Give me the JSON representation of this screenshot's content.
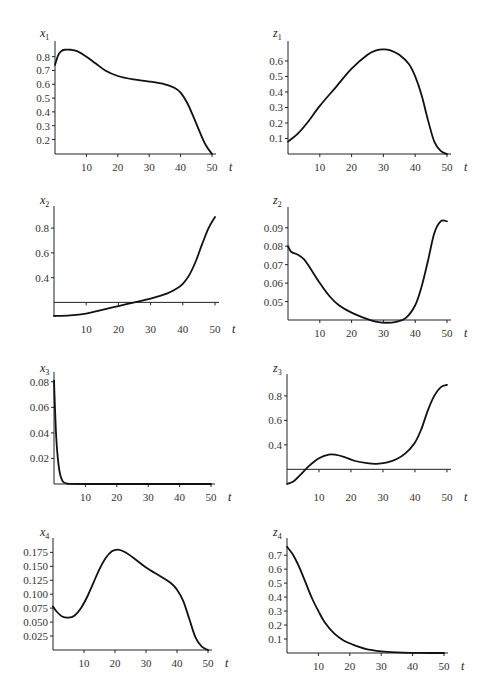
{
  "chart_data": [
    {
      "id": "x1",
      "type": "line",
      "title": "",
      "ylabel": "x1",
      "var": "x",
      "sub": "1",
      "xlabel": "t",
      "xlim": [
        0,
        50
      ],
      "ylim": [
        0.095,
        0.87
      ],
      "xticks": [
        10,
        20,
        30,
        40,
        50
      ],
      "yticks": [
        0.2,
        0.3,
        0.4,
        0.5,
        0.6,
        0.7,
        0.8
      ],
      "ytick_labels": [
        "0.2",
        "0.3",
        "0.4",
        "0.5",
        "0.6",
        "0.7",
        "0.8"
      ],
      "x": [
        0,
        1,
        2,
        3,
        5,
        7,
        10,
        13,
        16,
        20,
        25,
        30,
        35,
        38,
        40,
        42,
        44,
        46,
        48,
        50
      ],
      "y": [
        0.74,
        0.81,
        0.84,
        0.85,
        0.85,
        0.84,
        0.8,
        0.75,
        0.7,
        0.66,
        0.635,
        0.62,
        0.6,
        0.575,
        0.54,
        0.47,
        0.37,
        0.26,
        0.16,
        0.095
      ],
      "box": {
        "x0": 55,
        "x1": 212,
        "y0": 47,
        "y1": 154
      },
      "baseline": null,
      "label_pos": [
        40,
        37
      ]
    },
    {
      "id": "z1",
      "type": "line",
      "title": "",
      "ylabel": "z1",
      "var": "z",
      "sub": "1",
      "xlabel": "t",
      "xlim": [
        0,
        50
      ],
      "ylim": [
        0,
        0.69
      ],
      "xticks": [
        10,
        20,
        30,
        40,
        50
      ],
      "yticks": [
        0.1,
        0.2,
        0.3,
        0.4,
        0.5,
        0.6
      ],
      "ytick_labels": [
        "0.1",
        "0.2",
        "0.3",
        "0.4",
        "0.5",
        "0.6"
      ],
      "x": [
        0,
        3,
        6,
        10,
        15,
        20,
        25,
        28,
        30,
        32,
        35,
        38,
        40,
        42,
        44,
        46,
        48,
        50
      ],
      "y": [
        0.08,
        0.13,
        0.2,
        0.31,
        0.43,
        0.55,
        0.64,
        0.67,
        0.675,
        0.67,
        0.64,
        0.58,
        0.5,
        0.38,
        0.22,
        0.08,
        0.02,
        0.0
      ],
      "box": {
        "x0": 288,
        "x1": 447,
        "y0": 47,
        "y1": 154
      },
      "baseline": null,
      "label_pos": [
        273,
        37
      ]
    },
    {
      "id": "x2",
      "type": "line",
      "title": "",
      "ylabel": "x2",
      "var": "x",
      "sub": "2",
      "xlabel": "t",
      "xlim": [
        0,
        50
      ],
      "ylim": [
        0.09,
        0.93
      ],
      "xticks": [
        10,
        20,
        30,
        40,
        50
      ],
      "yticks": [
        0.4,
        0.6,
        0.8
      ],
      "ytick_labels": [
        "0.4",
        "0.6",
        "0.8"
      ],
      "x": [
        0,
        5,
        10,
        15,
        20,
        25,
        30,
        35,
        38,
        40,
        42,
        44,
        46,
        48,
        50
      ],
      "y": [
        0.09,
        0.095,
        0.11,
        0.14,
        0.17,
        0.2,
        0.23,
        0.27,
        0.31,
        0.35,
        0.42,
        0.53,
        0.67,
        0.8,
        0.89
      ],
      "box": {
        "x0": 54,
        "x1": 215,
        "y0": 212,
        "y1": 316
      },
      "baseline": 0.2,
      "label_pos": [
        40,
        204
      ]
    },
    {
      "id": "z2",
      "type": "line",
      "title": "",
      "ylabel": "z2",
      "var": "z",
      "sub": "2",
      "xlabel": "t",
      "xlim": [
        0,
        50
      ],
      "ylim": [
        0.04,
        0.098
      ],
      "xticks": [
        10,
        20,
        30,
        40,
        50
      ],
      "yticks": [
        0.05,
        0.06,
        0.07,
        0.08,
        0.09
      ],
      "ytick_labels": [
        "0.05",
        "0.06",
        "0.07",
        "0.08",
        "0.09"
      ],
      "x": [
        0,
        1,
        3,
        5,
        7,
        10,
        13,
        16,
        20,
        25,
        28,
        31,
        34,
        37,
        40,
        42,
        44,
        46,
        48,
        50
      ],
      "y": [
        0.08,
        0.077,
        0.0755,
        0.073,
        0.068,
        0.06,
        0.053,
        0.048,
        0.044,
        0.0405,
        0.039,
        0.0385,
        0.039,
        0.041,
        0.048,
        0.058,
        0.072,
        0.087,
        0.0935,
        0.0935
      ],
      "box": {
        "x0": 288,
        "x1": 447,
        "y0": 213,
        "y1": 320
      },
      "baseline": null,
      "label_pos": [
        273,
        204
      ]
    },
    {
      "id": "x3",
      "type": "line",
      "title": "",
      "ylabel": "x3",
      "var": "x",
      "sub": "3",
      "xlabel": "t",
      "xlim": [
        0,
        50
      ],
      "ylim": [
        0,
        0.083
      ],
      "xticks": [
        10,
        20,
        30,
        40,
        50
      ],
      "yticks": [
        0.02,
        0.04,
        0.06,
        0.08
      ],
      "ytick_labels": [
        "0.02",
        "0.04",
        "0.06",
        "0.08"
      ],
      "x": [
        0,
        0.3,
        0.6,
        1,
        1.5,
        2,
        2.5,
        3,
        4,
        5,
        10,
        20,
        30,
        40,
        50
      ],
      "y": [
        0.081,
        0.06,
        0.042,
        0.026,
        0.014,
        0.007,
        0.0035,
        0.0015,
        0.0004,
        0.0001,
        0,
        0,
        0,
        0,
        0
      ],
      "box": {
        "x0": 54,
        "x1": 211,
        "y0": 378,
        "y1": 484
      },
      "baseline": null,
      "label_pos": [
        40,
        372
      ]
    },
    {
      "id": "z3",
      "type": "line",
      "title": "",
      "ylabel": "z3",
      "var": "z",
      "sub": "3",
      "xlabel": "t",
      "xlim": [
        0,
        50
      ],
      "ylim": [
        0.08,
        0.93
      ],
      "xticks": [
        10,
        20,
        30,
        40,
        50
      ],
      "yticks": [
        0.4,
        0.6,
        0.8
      ],
      "ytick_labels": [
        "0.4",
        "0.6",
        "0.8"
      ],
      "x": [
        0,
        2,
        4,
        7,
        10,
        13,
        15,
        18,
        21,
        25,
        28,
        31,
        34,
        37,
        40,
        42,
        44,
        46,
        48,
        50
      ],
      "y": [
        0.08,
        0.1,
        0.15,
        0.23,
        0.29,
        0.32,
        0.32,
        0.3,
        0.27,
        0.25,
        0.245,
        0.255,
        0.28,
        0.33,
        0.42,
        0.53,
        0.68,
        0.8,
        0.87,
        0.89
      ],
      "box": {
        "x0": 287,
        "x1": 447,
        "y0": 380,
        "y1": 484
      },
      "baseline": 0.2,
      "label_pos": [
        273,
        372
      ]
    },
    {
      "id": "x4",
      "type": "line",
      "title": "",
      "ylabel": "x4",
      "var": "x",
      "sub": "4",
      "xlabel": "t",
      "xlim": [
        0,
        50
      ],
      "ylim": [
        0,
        0.19
      ],
      "xticks": [
        10,
        20,
        30,
        40,
        50
      ],
      "yticks": [
        0.025,
        0.05,
        0.075,
        0.1,
        0.125,
        0.15,
        0.175
      ],
      "ytick_labels": [
        "0.025",
        "0.050",
        "0.075",
        "0.100",
        "0.125",
        "0.150",
        "0.175"
      ],
      "x": [
        0,
        1,
        3,
        5,
        7,
        9,
        11,
        13,
        15,
        17,
        19,
        21,
        23,
        26,
        30,
        35,
        38,
        40,
        42,
        44,
        46,
        48,
        50
      ],
      "y": [
        0.078,
        0.07,
        0.06,
        0.058,
        0.062,
        0.075,
        0.095,
        0.12,
        0.145,
        0.165,
        0.177,
        0.18,
        0.176,
        0.165,
        0.148,
        0.131,
        0.12,
        0.108,
        0.088,
        0.055,
        0.022,
        0.006,
        0.0
      ],
      "box": {
        "x0": 53,
        "x1": 208,
        "y0": 544,
        "y1": 650
      },
      "baseline": null,
      "label_pos": [
        40,
        536
      ]
    },
    {
      "id": "z4",
      "type": "line",
      "title": "",
      "ylabel": "z4",
      "var": "z",
      "sub": "4",
      "xlabel": "t",
      "xlim": [
        0,
        50
      ],
      "ylim": [
        0,
        0.78
      ],
      "xticks": [
        10,
        20,
        30,
        40,
        50
      ],
      "yticks": [
        0.1,
        0.2,
        0.3,
        0.4,
        0.5,
        0.6,
        0.7
      ],
      "ytick_labels": [
        "0.1",
        "0.2",
        "0.3",
        "0.4",
        "0.5",
        "0.6",
        "0.7"
      ],
      "x": [
        0,
        2,
        4,
        6,
        8,
        10,
        12,
        15,
        18,
        21,
        25,
        30,
        35,
        40,
        45,
        50
      ],
      "y": [
        0.76,
        0.7,
        0.61,
        0.5,
        0.39,
        0.3,
        0.22,
        0.14,
        0.09,
        0.06,
        0.03,
        0.012,
        0.004,
        0.001,
        0,
        0
      ],
      "box": {
        "x0": 287,
        "x1": 444,
        "y0": 544,
        "y1": 653
      },
      "baseline": null,
      "label_pos": [
        273,
        536
      ]
    }
  ],
  "axis_label_t": "t"
}
